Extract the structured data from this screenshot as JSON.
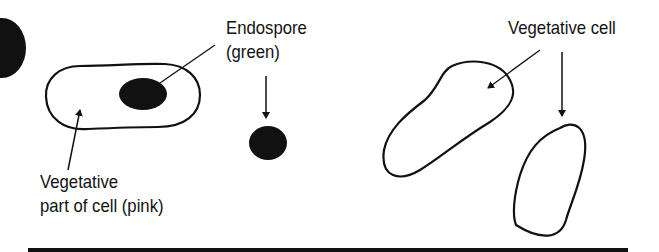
{
  "diagram": {
    "labels": {
      "endospore": [
        "Endospore",
        "(green)"
      ],
      "vegetative_part": [
        "Vegetative",
        "part of cell (pink)"
      ],
      "vegetative_cell": "Vegetative cell"
    },
    "colors": {
      "ink": "#111111",
      "background": "#ffffff"
    }
  }
}
